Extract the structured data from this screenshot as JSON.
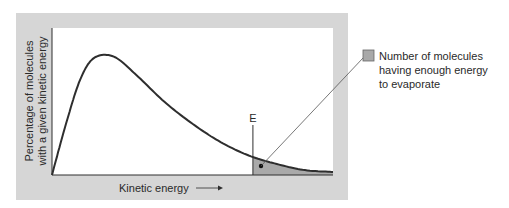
{
  "chart_data": {
    "type": "line",
    "title": "",
    "xlabel": "Kinetic energy",
    "ylabel_lines": [
      "Percentage of molecules",
      "with a given kinetic energy"
    ],
    "x_range": [
      0,
      1
    ],
    "y_range": [
      0,
      1
    ],
    "grid": false,
    "series": [
      {
        "name": "Kinetic energy distribution",
        "x": [
          0,
          0.05,
          0.1,
          0.15,
          0.22,
          0.3,
          0.4,
          0.5,
          0.6,
          0.7,
          0.8,
          0.9,
          1.0
        ],
        "y": [
          0,
          0.42,
          0.78,
          0.96,
          0.97,
          0.82,
          0.6,
          0.42,
          0.27,
          0.16,
          0.09,
          0.04,
          0.025
        ]
      }
    ],
    "threshold": {
      "label": "E",
      "x": 0.715
    },
    "shaded_region": "area under curve for x >= E",
    "legend": {
      "placement": "right",
      "entry": "Number of molecules having enough energy to evaporate"
    }
  },
  "labels": {
    "xlabel": "Kinetic energy",
    "arrow": "→",
    "ylabel1": "Percentage of molecules",
    "ylabel2": "with a given kinetic energy",
    "threshold": "E",
    "legend1": "Number of molecules",
    "legend2": "having enough energy",
    "legend3": "to evaporate"
  },
  "colors": {
    "panel": "#d6d6d6",
    "plot_bg": "#ffffff",
    "curve": "#2e2e2e",
    "shade": "#a9a9a9"
  }
}
